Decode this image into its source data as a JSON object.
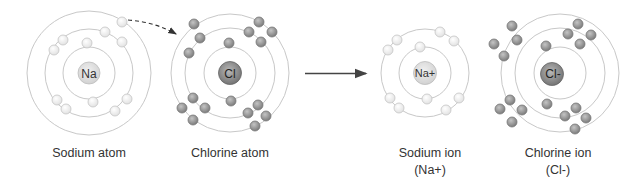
{
  "colors": {
    "shell": "#c8c8c8",
    "na_electron_fill": "#f2f2f2",
    "na_electron_stroke": "#c6c6c6",
    "cl_electron_fill": "#9a9a9a",
    "cl_electron_stroke": "#7a7a7a",
    "na_nucleus": "#d9d9d9",
    "cl_nucleus": "#8a8a8a",
    "arrow": "#444444",
    "text": "#333333"
  },
  "panels": [
    {
      "id": "sodium-atom",
      "nucleus_label": "Na",
      "caption": "Sodium atom",
      "caption2": "",
      "center": [
        89,
        73
      ],
      "shells": [
        26,
        44,
        62
      ],
      "electron_type": "light",
      "electrons_per_shell": [
        2,
        8,
        1
      ]
    },
    {
      "id": "chlorine-atom",
      "nucleus_label": "Cl",
      "caption": "Chlorine atom",
      "caption2": "",
      "center": [
        230,
        73
      ],
      "shells": [
        26,
        45,
        59
      ],
      "electron_type": "dark",
      "electrons_per_shell": [
        2,
        8,
        7
      ]
    },
    {
      "id": "sodium-ion",
      "nucleus_label": "Na+",
      "caption": "Sodium ion",
      "caption2": "(Na+)",
      "center": [
        425,
        73
      ],
      "shells": [
        26,
        44
      ],
      "electron_type": "light",
      "electrons_per_shell": [
        2,
        8
      ]
    },
    {
      "id": "chlorine-ion",
      "nucleus_label": "Cl-",
      "caption": "Chlorine ion",
      "caption2": "(Cl-)",
      "center": [
        560,
        73
      ],
      "shells": [
        26,
        45,
        59
      ],
      "electron_type": "dark",
      "electrons_per_shell": [
        2,
        8,
        8
      ]
    }
  ],
  "arrows": {
    "transfer": "electron-transfer-dashed-arrow",
    "reaction": "reaction-arrow"
  }
}
